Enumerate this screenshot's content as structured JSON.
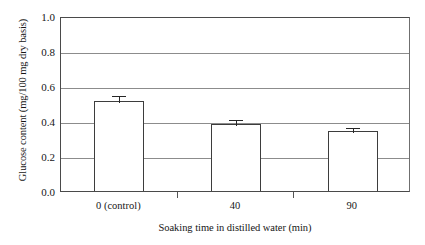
{
  "chart_data": {
    "type": "bar",
    "title": "",
    "subtitle": "",
    "xlabel": "Soaking time in distilled water (min)",
    "ylabel": "Glucose content (mg/100 mg dry basis)",
    "categories": [
      "0 (control)",
      "40",
      "90"
    ],
    "values": [
      0.515,
      0.385,
      0.345
    ],
    "errors": [
      0.04,
      0.03,
      0.025
    ],
    "error_type": "symmetric-upper-cap",
    "ylim": [
      0.0,
      1.0
    ],
    "ytick_labels": [
      "0.0",
      "0.2",
      "0.4",
      "0.6",
      "0.8",
      "1.0"
    ],
    "ytick_values": [
      0.0,
      0.2,
      0.4,
      0.6,
      0.8,
      1.0
    ],
    "grid": "horizontal",
    "legend": "none",
    "series": [
      {
        "name": "Glucose content",
        "values": [
          0.515,
          0.385,
          0.345
        ],
        "errors": [
          0.04,
          0.03,
          0.025
        ]
      }
    ],
    "colors": {
      "bar_fill": "#ffffff",
      "bar_edge": "#3d3d3d",
      "gridline": "#8c8c8c",
      "axis": "#4a4a4a",
      "error_bar": "#262626",
      "background": "#ffffff",
      "text": "#161616"
    }
  }
}
